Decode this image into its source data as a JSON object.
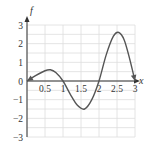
{
  "chart_data": {
    "type": "line",
    "title": "",
    "xlabel": "x",
    "ylabel": "f",
    "xlim": [
      0,
      3
    ],
    "ylim": [
      -3,
      3
    ],
    "grid": true,
    "x_ticks": [
      "0.5",
      "1",
      "1.5",
      "2",
      "2.5",
      "3"
    ],
    "y_ticks": [
      "3",
      "2",
      "1",
      "0",
      "−1",
      "−2",
      "−3"
    ],
    "series": [
      {
        "name": "f",
        "x": [
          0,
          0.25,
          0.5,
          0.65,
          0.8,
          1.0,
          1.2,
          1.4,
          1.6,
          1.8,
          2.0,
          2.2,
          2.4,
          2.55,
          2.7,
          2.85,
          3.0
        ],
        "values": [
          0,
          0.3,
          0.55,
          0.6,
          0.45,
          0,
          -0.7,
          -1.3,
          -1.5,
          -1.0,
          0,
          1.4,
          2.4,
          2.6,
          2.2,
          1.2,
          0
        ]
      }
    ],
    "annotations": [
      "arrowheads at both ends of curve"
    ]
  },
  "colors": {
    "curve": "#555555",
    "axis": "#333333",
    "grid": "#dddddd"
  }
}
